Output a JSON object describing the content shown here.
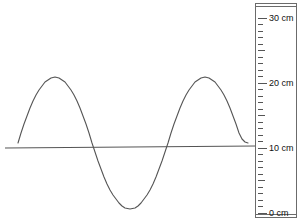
{
  "figure": {
    "title": "",
    "ruler_unit": "cm"
  },
  "ruler": {
    "name": "vertical-ruler",
    "min": 0,
    "max": 30,
    "labels": [
      {
        "value": 30,
        "text": "30 cm"
      },
      {
        "value": 20,
        "text": "20 cm"
      },
      {
        "value": 10,
        "text": "10 cm"
      },
      {
        "value": 0,
        "text": "0 cm"
      }
    ]
  },
  "chart_data": {
    "type": "line",
    "title": "",
    "xlabel": "",
    "ylabel": "",
    "ylim": [
      0,
      30
    ],
    "xlim": [
      0,
      258
    ],
    "grid": false,
    "legend": null,
    "axis_unit": "cm",
    "baseline": {
      "name": "equilibrium-line",
      "value_cm": 10,
      "x_start": 5,
      "x_end": 256,
      "color": "#555555"
    },
    "series": [
      {
        "name": "wave",
        "shape": "sine",
        "color": "#555555",
        "amplitude_cm": 9.5,
        "midline_cm": 10.3,
        "crest_cm": 20,
        "trough_cm": 1,
        "wavelength_px": 150,
        "x_start_px": 18,
        "x_end_px": 248,
        "zero_crossings_px": [
          18,
          92,
          168,
          248
        ],
        "crest_x_px": [
          55,
          205
        ],
        "trough_x_px": [
          130
        ],
        "points_px": [
          [
            18,
            143
          ],
          [
            21,
            133
          ],
          [
            24,
            124
          ],
          [
            27,
            116
          ],
          [
            30,
            108
          ],
          [
            33,
            101
          ],
          [
            36,
            95
          ],
          [
            39,
            90
          ],
          [
            42,
            86
          ],
          [
            45,
            82
          ],
          [
            48,
            80
          ],
          [
            51,
            78
          ],
          [
            55,
            77
          ],
          [
            59,
            78
          ],
          [
            62,
            80
          ],
          [
            65,
            82
          ],
          [
            68,
            86
          ],
          [
            71,
            90
          ],
          [
            74,
            95
          ],
          [
            77,
            101
          ],
          [
            80,
            108
          ],
          [
            83,
            116
          ],
          [
            86,
            124
          ],
          [
            89,
            133
          ],
          [
            92,
            143
          ],
          [
            95,
            152
          ],
          [
            98,
            161
          ],
          [
            101,
            169
          ],
          [
            104,
            177
          ],
          [
            107,
            184
          ],
          [
            110,
            190
          ],
          [
            113,
            195
          ],
          [
            116,
            199
          ],
          [
            119,
            203
          ],
          [
            122,
            206
          ],
          [
            125,
            208
          ],
          [
            130,
            209
          ],
          [
            135,
            208
          ],
          [
            138,
            206
          ],
          [
            141,
            203
          ],
          [
            144,
            199
          ],
          [
            147,
            195
          ],
          [
            150,
            190
          ],
          [
            153,
            184
          ],
          [
            156,
            177
          ],
          [
            159,
            169
          ],
          [
            162,
            161
          ],
          [
            165,
            152
          ],
          [
            168,
            143
          ],
          [
            171,
            133
          ],
          [
            174,
            124
          ],
          [
            177,
            116
          ],
          [
            180,
            108
          ],
          [
            183,
            101
          ],
          [
            186,
            95
          ],
          [
            189,
            90
          ],
          [
            192,
            86
          ],
          [
            195,
            82
          ],
          [
            198,
            80
          ],
          [
            201,
            78
          ],
          [
            205,
            77
          ],
          [
            209,
            78
          ],
          [
            212,
            80
          ],
          [
            215,
            82
          ],
          [
            218,
            86
          ],
          [
            221,
            90
          ],
          [
            224,
            95
          ],
          [
            227,
            101
          ],
          [
            230,
            108
          ],
          [
            233,
            116
          ],
          [
            236,
            124
          ],
          [
            239,
            133
          ],
          [
            242,
            139
          ],
          [
            245,
            142
          ],
          [
            248,
            143
          ]
        ]
      }
    ]
  }
}
